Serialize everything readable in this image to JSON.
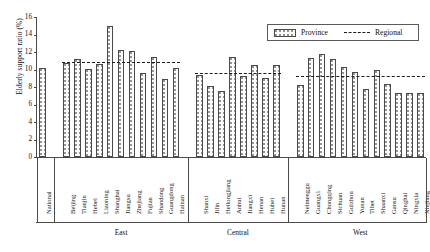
{
  "chart_data": {
    "type": "bar",
    "title": "",
    "xlabel": "",
    "ylabel": "Elderly support ratio (%)",
    "ylim": [
      0,
      16
    ],
    "yticks": [
      0,
      2,
      4,
      6,
      8,
      10,
      12,
      14,
      16
    ],
    "grid": false,
    "legend": {
      "position": "top-right",
      "entries": [
        {
          "label": "Province",
          "marker": "patterned-bar"
        },
        {
          "label": "Regional",
          "marker": "dashed-line"
        }
      ]
    },
    "groups": [
      {
        "name": "",
        "regional": null,
        "categories": [
          "National"
        ],
        "values": [
          10.2
        ]
      },
      {
        "name": "East",
        "regional": 10.9,
        "categories": [
          "Beijing",
          "Tianjin",
          "Hebei",
          "Liaoning",
          "Shanghai",
          "Jiangsu",
          "Zhejiang",
          "Fujian",
          "Shandong",
          "Guangdong",
          "Hainan"
        ],
        "values": [
          10.8,
          11.2,
          10.1,
          10.6,
          15.0,
          12.2,
          12.1,
          9.6,
          11.4,
          8.9,
          10.2
        ]
      },
      {
        "name": "Central",
        "regional": 9.6,
        "categories": [
          "Shanxi",
          "Jilin",
          "Heilongjiang",
          "Anhui",
          "Jiangxi",
          "Henan",
          "Hubei",
          "Hunan"
        ],
        "values": [
          9.4,
          8.1,
          7.5,
          11.4,
          9.3,
          10.5,
          9.0,
          10.5
        ]
      },
      {
        "name": "West",
        "regional": 9.3,
        "categories": [
          "Neimenggu",
          "Guangxi",
          "Chongqing",
          "Sichuan",
          "Guizhou",
          "Yunan",
          "Tibet",
          "Shaanxi",
          "Gansu",
          "Qinghai",
          "Ningxia",
          "Xinjiang"
        ],
        "values": [
          8.2,
          11.3,
          11.8,
          11.2,
          10.3,
          9.7,
          7.8,
          9.9,
          8.3,
          7.3,
          7.3,
          7.3
        ]
      }
    ]
  }
}
